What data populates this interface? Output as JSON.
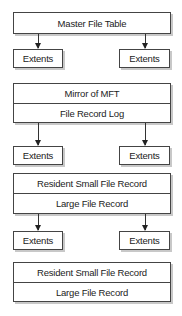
{
  "diagram": {
    "blocks": [
      {
        "rows": [
          "Master File Table"
        ]
      },
      {
        "rows": [
          "Mirror of MFT",
          "File Record Log"
        ]
      },
      {
        "rows": [
          "Resident Small File Record",
          "Large File Record"
        ]
      },
      {
        "rows": [
          "Resident Small File Record",
          "Large File Record"
        ]
      }
    ],
    "extents": [
      {
        "left": "Extents",
        "right": "Extents"
      },
      {
        "left": "Extents",
        "right": "Extents"
      },
      {
        "left": "Extents",
        "right": "Extents"
      }
    ]
  }
}
